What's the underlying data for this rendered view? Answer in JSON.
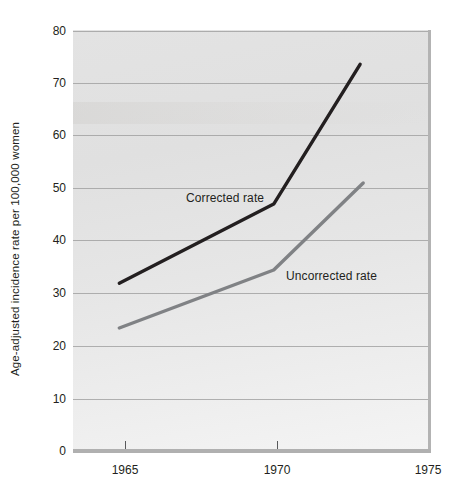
{
  "chart_data": {
    "type": "line",
    "title": "",
    "xlabel": "",
    "ylabel": "Age-adjusted incidence rate per 100,000 women",
    "xlim": [
      1963.5,
      1975
    ],
    "ylim": [
      0,
      80
    ],
    "xticks": [
      1965,
      1970,
      1975
    ],
    "xtick_labels": [
      "1965",
      "1970",
      "1975"
    ],
    "yticks": [
      0,
      10,
      20,
      30,
      40,
      50,
      60,
      70,
      80
    ],
    "ytick_labels": [
      "0",
      "10",
      "20",
      "30",
      "40",
      "50",
      "60",
      "70",
      "80"
    ],
    "grid": "horizontal",
    "legend_position": "inline-annotations",
    "series": [
      {
        "name": "Corrected rate",
        "color": "#231f20",
        "x": [
          1965,
          1970,
          1972.8
        ],
        "values": [
          32,
          47,
          73.5
        ]
      },
      {
        "name": "Uncorrected rate",
        "color": "#808285",
        "x": [
          1965,
          1970,
          1972.9
        ],
        "values": [
          23.5,
          34.5,
          51
        ]
      }
    ],
    "annotations": [
      {
        "text": "Corrected rate",
        "x": 1970,
        "y": 45
      },
      {
        "text": "Uncorrected rate",
        "x": 1971,
        "y": 33
      }
    ]
  },
  "colors": {
    "corrected_line": "#231f20",
    "uncorrected_line": "#808285",
    "gridline": "#9a9a9a",
    "axis": "#b0b0b0",
    "plot_background": "#e6e6e6",
    "text": "#231f20",
    "page_background": "#ffffff"
  }
}
